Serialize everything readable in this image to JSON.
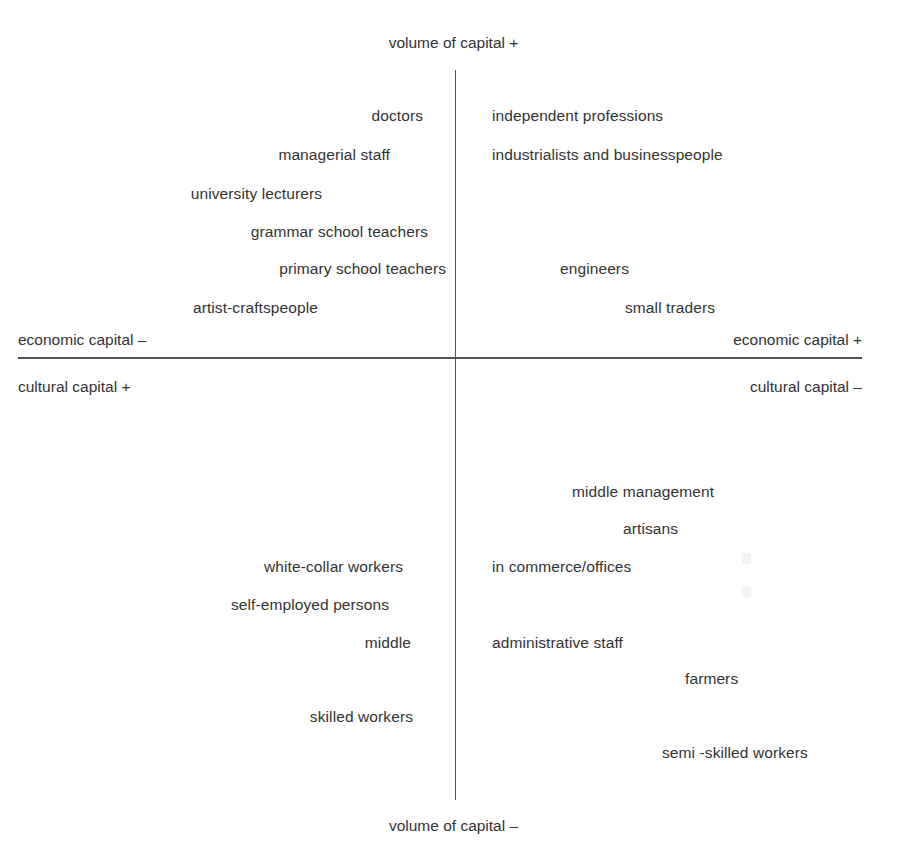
{
  "diagram": {
    "title_top": "volume of capital +",
    "title_bottom": "volume of capital –",
    "axis_labels": {
      "economic_negative": "economic capital –",
      "economic_positive": "economic capital +",
      "cultural_positive": "cultural capital +",
      "cultural_negative": "cultural capital –"
    },
    "colors": {
      "text": "#333333",
      "line": "#555555",
      "background": "#ffffff"
    },
    "quadrants": {
      "top_left": {
        "name": "high cultural capital / low economic capital",
        "items": [
          {
            "text": "doctors",
            "right": 423,
            "top": 108
          },
          {
            "text": "managerial staff",
            "right": 390,
            "top": 147
          },
          {
            "text": "university lecturers",
            "right": 322,
            "top": 186
          },
          {
            "text": "grammar school teachers",
            "right": 428,
            "top": 224
          },
          {
            "text": "primary school teachers",
            "right": 446,
            "top": 261
          },
          {
            "text": "artist-craftspeople",
            "right": 318,
            "top": 300
          }
        ]
      },
      "top_right": {
        "name": "high economic capital / low cultural capital",
        "items": [
          {
            "text": "independent professions",
            "left": 492,
            "top": 108
          },
          {
            "text": "industrialists and businesspeople",
            "left": 492,
            "top": 147
          },
          {
            "text": "engineers",
            "left": 560,
            "top": 261
          },
          {
            "text": "small traders",
            "left": 625,
            "top": 300
          }
        ]
      },
      "bottom_left": {
        "name": "lower volume / high cultural capital",
        "items": [
          {
            "text": "white-collar workers",
            "right": 403,
            "top": 559
          },
          {
            "text": "self-employed persons",
            "right": 389,
            "top": 597
          },
          {
            "text": "middle",
            "right": 411,
            "top": 635
          },
          {
            "text": "skilled workers",
            "right": 413,
            "top": 709
          }
        ]
      },
      "bottom_right": {
        "name": "lower volume / low cultural capital",
        "items": [
          {
            "text": "middle management",
            "left": 572,
            "top": 484
          },
          {
            "text": "artisans",
            "left": 623,
            "top": 521
          },
          {
            "text": "in commerce/offices",
            "left": 492,
            "top": 559
          },
          {
            "text": "administrative staff",
            "left": 492,
            "top": 635
          },
          {
            "text": "farmers",
            "left": 685,
            "top": 671
          },
          {
            "text": "semi -skilled workers",
            "left": 662,
            "top": 745
          }
        ]
      }
    },
    "geometry": {
      "vertical_axis_x": 455,
      "vertical_axis_top": 70,
      "vertical_axis_bottom": 800,
      "horizontal_axis_y": 357,
      "horizontal_axis_left": 18,
      "horizontal_axis_right": 862
    }
  }
}
